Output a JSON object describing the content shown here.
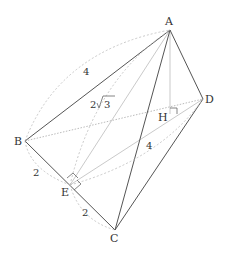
{
  "diagram": {
    "type": "3d-tetrahedron",
    "points": {
      "A": {
        "label": "A",
        "x": 170,
        "y": 30
      },
      "B": {
        "label": "B",
        "x": 25,
        "y": 141
      },
      "C": {
        "label": "C",
        "x": 115,
        "y": 230
      },
      "D": {
        "label": "D",
        "x": 203,
        "y": 99
      },
      "E": {
        "label": "E",
        "x": 70,
        "y": 185
      },
      "H": {
        "label": "H",
        "x": 170,
        "y": 114
      }
    },
    "measurements": {
      "AB": "4",
      "AE": "2",
      "AE_root": "3",
      "BE": "2",
      "EC": "2",
      "ED": "4"
    },
    "colors": {
      "solid_edge": "#555555",
      "hidden_edge": "#aaaaaa",
      "label": "#333333"
    }
  }
}
